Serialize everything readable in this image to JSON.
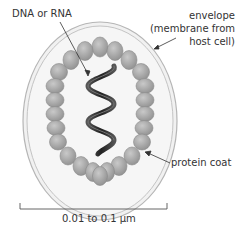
{
  "diagram": {
    "labels": {
      "genome": "DNA or RNA",
      "envelope_line1": "envelope",
      "envelope_line2": "(membrane from",
      "envelope_line3": "host cell)",
      "protein_coat": "protein coat",
      "scale": "0.01 to 0.1 µm"
    },
    "colors": {
      "envelope_fill": "#f1f1f1",
      "envelope_stroke": "#b8b8b8",
      "capsomere_fill": "#a9a9a9",
      "capsomere_stroke": "#8a8a8a",
      "helix": "#3a3a3a",
      "text": "#333333"
    }
  }
}
